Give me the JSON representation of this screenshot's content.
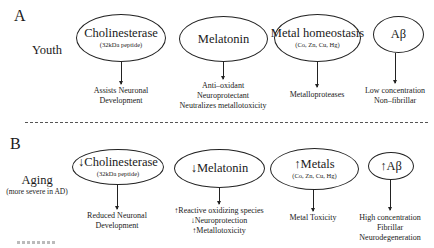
{
  "panels": [
    {
      "label": "A",
      "row_label": "Youth",
      "row_sublabel": "",
      "nodes": [
        {
          "title": "Cholinesterase",
          "subtitle": "(32kDa peptide)",
          "effects": [
            "Assists Neuronal",
            "Development"
          ]
        },
        {
          "title": "Melatonin",
          "subtitle": "",
          "effects": [
            "Anti–oxidant",
            "Neuroprotectant",
            "Neutralizes metallotoxicity"
          ]
        },
        {
          "title": "Metal homeostasis",
          "subtitle": "(Co, Zn, Cu, Hg)",
          "effects": [
            "Metalloproteases"
          ]
        },
        {
          "title": "Aβ",
          "subtitle": "",
          "effects": [
            "Low concentration",
            "Non–fibrillar"
          ]
        }
      ]
    },
    {
      "label": "B",
      "row_label": "Aging",
      "row_sublabel": "(more severe in AD)",
      "nodes": [
        {
          "title": "↓Cholinesterase",
          "subtitle": "(32kDa peptide)",
          "effects": [
            "Reduced Neuronal",
            "Development"
          ]
        },
        {
          "title": "↓Melatonin",
          "subtitle": "",
          "effects": [
            "↑Reactive oxidizing species",
            "↓Neuroprotection",
            "↑Metallotoxicity"
          ]
        },
        {
          "title": "↑Metals",
          "subtitle": "(Co, Zn, Cu, Hg)",
          "effects": [
            "Metal Toxicity"
          ]
        },
        {
          "title": "↑Aβ",
          "subtitle": "",
          "effects": [
            "High concentration",
            "Fibrillar",
            "Neurodegeneration"
          ]
        }
      ]
    }
  ]
}
